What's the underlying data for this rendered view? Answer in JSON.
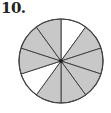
{
  "problem": {
    "number_label": "10."
  },
  "figure": {
    "type": "fraction-circle",
    "total_parts": 10,
    "shaded_parts": 8,
    "unshaded_parts": 2,
    "sectors": [
      {
        "index": 0,
        "shaded": false
      },
      {
        "index": 1,
        "shaded": true
      },
      {
        "index": 2,
        "shaded": true
      },
      {
        "index": 3,
        "shaded": true
      },
      {
        "index": 4,
        "shaded": true
      },
      {
        "index": 5,
        "shaded": true
      },
      {
        "index": 6,
        "shaded": false
      },
      {
        "index": 7,
        "shaded": true
      },
      {
        "index": 8,
        "shaded": true
      },
      {
        "index": 9,
        "shaded": true
      }
    ],
    "colors": {
      "shaded": "#c8c8c8",
      "unshaded": "#ffffff",
      "stroke": "#444444"
    }
  }
}
